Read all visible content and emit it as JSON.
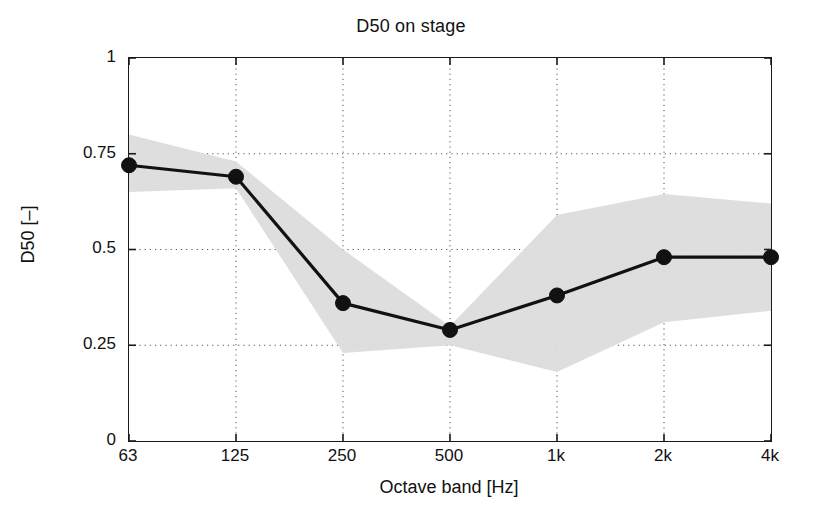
{
  "chart_data": {
    "type": "line",
    "title": "D50 on stage",
    "xlabel": "Octave band [Hz]",
    "ylabel": "D50 [–]",
    "categories": [
      "63",
      "125",
      "250",
      "500",
      "1k",
      "2k",
      "4k"
    ],
    "values": [
      0.72,
      0.69,
      0.36,
      0.29,
      0.38,
      0.48,
      0.48
    ],
    "band_upper": [
      0.8,
      0.73,
      0.5,
      0.3,
      0.59,
      0.645,
      0.62
    ],
    "band_lower": [
      0.65,
      0.66,
      0.23,
      0.25,
      0.18,
      0.31,
      0.34
    ],
    "band_label": "shaded range band",
    "series_name": "D50 mean",
    "ylim": [
      0,
      1
    ],
    "yticks": [
      0,
      0.25,
      0.5,
      0.75,
      1
    ],
    "ytick_labels": [
      "0",
      "0.25",
      "0.5",
      "0.75",
      "1"
    ],
    "grid": true,
    "grid_style": "dotted",
    "legend": "none",
    "marker": "filled-circle",
    "line_color": "#111111",
    "band_color": "#dcdcdc",
    "background_color": "#ffffff"
  }
}
